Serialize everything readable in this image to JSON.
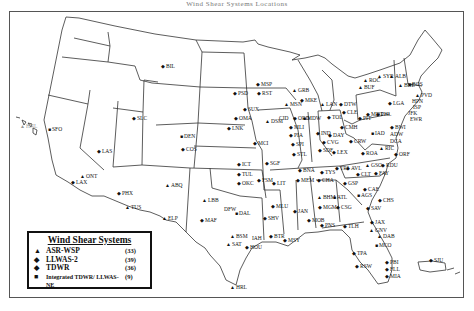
{
  "title": "Wind Shear Systems Locations",
  "legend": {
    "title": "Wind Shear Systems",
    "items": [
      {
        "symbol": "▲",
        "icon": "triangle-icon",
        "label": "ASR-WSP",
        "count": "(33)"
      },
      {
        "symbol": "◆",
        "icon": "diamond-icon",
        "label": "LLWAS-2",
        "count": "(39)"
      },
      {
        "symbol": "◆",
        "icon": "star-icon",
        "label": "TDWR",
        "count": "(36)"
      },
      {
        "symbol": "■",
        "icon": "square-icon",
        "label": "Integrated TDWR/ LLWAS-NE",
        "count": "(9)"
      }
    ]
  },
  "stations": [
    {
      "code": "BIL",
      "x": 164,
      "y": 66,
      "sym": "◆"
    },
    {
      "code": "SFO",
      "x": 51,
      "y": 129,
      "sym": "■"
    },
    {
      "code": "HNL",
      "x": 23,
      "y": 126,
      "sym": "▲",
      "gray": true
    },
    {
      "code": "SLC",
      "x": 135,
      "y": 118,
      "sym": "◆"
    },
    {
      "code": "LAS",
      "x": 100,
      "y": 151,
      "sym": "◆"
    },
    {
      "code": "LAX",
      "x": 74,
      "y": 182,
      "sym": "◆"
    },
    {
      "code": "ONT",
      "x": 83,
      "y": 176,
      "sym": "▲"
    },
    {
      "code": "PHX",
      "x": 120,
      "y": 193,
      "sym": "◆"
    },
    {
      "code": "TUS",
      "x": 128,
      "y": 207,
      "sym": "▲"
    },
    {
      "code": "ABQ",
      "x": 168,
      "y": 185,
      "sym": "▲"
    },
    {
      "code": "ELP",
      "x": 165,
      "y": 218,
      "sym": "▲"
    },
    {
      "code": "DEN",
      "x": 183,
      "y": 136,
      "sym": "■"
    },
    {
      "code": "COS",
      "x": 184,
      "y": 149,
      "sym": "◆"
    },
    {
      "code": "PSD",
      "x": 236,
      "y": 93,
      "sym": "◆"
    },
    {
      "code": "SUX",
      "x": 246,
      "y": 109,
      "sym": "◆"
    },
    {
      "code": "OMA",
      "x": 237,
      "y": 118,
      "sym": "◆"
    },
    {
      "code": "LNK",
      "x": 230,
      "y": 128,
      "sym": "◆"
    },
    {
      "code": "MSP",
      "x": 259,
      "y": 84,
      "sym": "◆"
    },
    {
      "code": "RST",
      "x": 260,
      "y": 93,
      "sym": "◆"
    },
    {
      "code": "DSM",
      "x": 268,
      "y": 121,
      "sym": "▲"
    },
    {
      "code": "MCI",
      "x": 256,
      "y": 143,
      "sym": "◆"
    },
    {
      "code": "ICT",
      "x": 240,
      "y": 164,
      "sym": "◆"
    },
    {
      "code": "SGF",
      "x": 268,
      "y": 163,
      "sym": "◆"
    },
    {
      "code": "TUL",
      "x": 240,
      "y": 174,
      "sym": "◆"
    },
    {
      "code": "OKC",
      "x": 240,
      "y": 183,
      "sym": "◆"
    },
    {
      "code": "FSM",
      "x": 260,
      "y": 180,
      "sym": "◆"
    },
    {
      "code": "LIT",
      "x": 275,
      "y": 183,
      "sym": "◆"
    },
    {
      "code": "LBB",
      "x": 205,
      "y": 200,
      "sym": "▲"
    },
    {
      "code": "MAF",
      "x": 203,
      "y": 220,
      "sym": "◆"
    },
    {
      "code": "DFW",
      "x": 227,
      "y": 209,
      "sym": ""
    },
    {
      "code": "DAL",
      "x": 238,
      "y": 213,
      "sym": "■"
    },
    {
      "code": "SHV",
      "x": 266,
      "y": 218,
      "sym": "◆"
    },
    {
      "code": "MLU",
      "x": 274,
      "y": 206,
      "sym": "◆"
    },
    {
      "code": "BSM",
      "x": 233,
      "y": 236,
      "sym": "▲"
    },
    {
      "code": "SAT",
      "x": 229,
      "y": 244,
      "sym": "▲"
    },
    {
      "code": "IAH",
      "x": 255,
      "y": 238,
      "sym": ""
    },
    {
      "code": "HOU",
      "x": 248,
      "y": 247,
      "sym": "◆"
    },
    {
      "code": "BTR",
      "x": 272,
      "y": 236,
      "sym": "◆"
    },
    {
      "code": "MSY",
      "x": 286,
      "y": 240,
      "sym": "◆"
    },
    {
      "code": "HRL",
      "x": 233,
      "y": 287,
      "sym": "▲"
    },
    {
      "code": "GRB",
      "x": 295,
      "y": 90,
      "sym": "▲"
    },
    {
      "code": "MKE",
      "x": 303,
      "y": 100,
      "sym": "◆"
    },
    {
      "code": "MSN",
      "x": 287,
      "y": 104,
      "sym": "▲"
    },
    {
      "code": "CID",
      "x": 282,
      "y": 118,
      "sym": ""
    },
    {
      "code": "ORD",
      "x": 296,
      "y": 118,
      "sym": "◆"
    },
    {
      "code": "MDW",
      "x": 306,
      "y": 118,
      "sym": "■"
    },
    {
      "code": "MLI",
      "x": 292,
      "y": 127,
      "sym": "◆"
    },
    {
      "code": "PIA",
      "x": 292,
      "y": 135,
      "sym": "◆"
    },
    {
      "code": "SPI",
      "x": 294,
      "y": 144,
      "sym": "◆"
    },
    {
      "code": "STL",
      "x": 295,
      "y": 154,
      "sym": "◆"
    },
    {
      "code": "LAN",
      "x": 323,
      "y": 104,
      "sym": "▲"
    },
    {
      "code": "DTW",
      "x": 342,
      "y": 104,
      "sym": "◆"
    },
    {
      "code": "TOL",
      "x": 330,
      "y": 117,
      "sym": "◆"
    },
    {
      "code": "CLE",
      "x": 345,
      "y": 112,
      "sym": "◆"
    },
    {
      "code": "CMH",
      "x": 343,
      "y": 127,
      "sym": "◆"
    },
    {
      "code": "PIT",
      "x": 361,
      "y": 118,
      "sym": "◆"
    },
    {
      "code": "IND",
      "x": 319,
      "y": 133,
      "sym": "◆"
    },
    {
      "code": "DAY",
      "x": 331,
      "y": 135,
      "sym": "◆"
    },
    {
      "code": "CVG",
      "x": 325,
      "y": 142,
      "sym": "◆"
    },
    {
      "code": "SDF",
      "x": 321,
      "y": 150,
      "sym": "◆"
    },
    {
      "code": "LEX",
      "x": 335,
      "y": 152,
      "sym": "◆"
    },
    {
      "code": "CRW",
      "x": 352,
      "y": 141,
      "sym": "◆"
    },
    {
      "code": "ROA",
      "x": 364,
      "y": 153,
      "sym": "◆"
    },
    {
      "code": "RIC",
      "x": 382,
      "y": 148,
      "sym": "▲"
    },
    {
      "code": "ORF",
      "x": 397,
      "y": 154,
      "sym": "◆"
    },
    {
      "code": "BUF",
      "x": 361,
      "y": 87,
      "sym": "▲"
    },
    {
      "code": "ROC",
      "x": 366,
      "y": 80,
      "sym": "▲"
    },
    {
      "code": "SYR",
      "x": 380,
      "y": 76,
      "sym": "▲"
    },
    {
      "code": "ALB",
      "x": 392,
      "y": 76,
      "sym": "▲"
    },
    {
      "code": "BDL",
      "x": 401,
      "y": 85,
      "sym": "▲"
    },
    {
      "code": "BOS",
      "x": 411,
      "y": 84,
      "sym": "■"
    },
    {
      "code": "PVD",
      "x": 418,
      "y": 95,
      "sym": "▲"
    },
    {
      "code": "HPN",
      "x": 415,
      "y": 101,
      "sym": ""
    },
    {
      "code": "ISP",
      "x": 416,
      "y": 107,
      "sym": ""
    },
    {
      "code": "LGA",
      "x": 391,
      "y": 103,
      "sym": "◆"
    },
    {
      "code": "JFK",
      "x": 411,
      "y": 113,
      "sym": ""
    },
    {
      "code": "EWR",
      "x": 413,
      "y": 119,
      "sym": ""
    },
    {
      "code": "MDT",
      "x": 369,
      "y": 114,
      "sym": "◆"
    },
    {
      "code": "PHL",
      "x": 379,
      "y": 114,
      "sym": "◆"
    },
    {
      "code": "BWI",
      "x": 393,
      "y": 127,
      "sym": "◆"
    },
    {
      "code": "ADW",
      "x": 393,
      "y": 134,
      "sym": ""
    },
    {
      "code": "DCA",
      "x": 393,
      "y": 141,
      "sym": ""
    },
    {
      "code": "IAD",
      "x": 374,
      "y": 133,
      "sym": "■"
    },
    {
      "code": "TYS",
      "x": 323,
      "y": 172,
      "sym": "◆"
    },
    {
      "code": "BNA",
      "x": 301,
      "y": 170,
      "sym": "◆"
    },
    {
      "code": "TRI",
      "x": 338,
      "y": 168,
      "sym": "◆"
    },
    {
      "code": "MEM",
      "x": 299,
      "y": 180,
      "sym": "◆"
    },
    {
      "code": "CHA",
      "x": 320,
      "y": 180,
      "sym": "◆"
    },
    {
      "code": "AVL",
      "x": 349,
      "y": 168,
      "sym": "◆"
    },
    {
      "code": "GSO",
      "x": 368,
      "y": 165,
      "sym": "▲"
    },
    {
      "code": "RDU",
      "x": 384,
      "y": 165,
      "sym": "◆"
    },
    {
      "code": "CLT",
      "x": 359,
      "y": 174,
      "sym": "◆"
    },
    {
      "code": "FAY",
      "x": 377,
      "y": 173,
      "sym": "◆"
    },
    {
      "code": "GSP",
      "x": 346,
      "y": 183,
      "sym": "◆"
    },
    {
      "code": "CAE",
      "x": 366,
      "y": 189,
      "sym": "◆"
    },
    {
      "code": "CHS",
      "x": 381,
      "y": 200,
      "sym": "◆"
    },
    {
      "code": "AGS",
      "x": 360,
      "y": 195,
      "sym": "■"
    },
    {
      "code": "BHM",
      "x": 320,
      "y": 197,
      "sym": "▲"
    },
    {
      "code": "ATL",
      "x": 336,
      "y": 197,
      "sym": "■"
    },
    {
      "code": "CSG",
      "x": 339,
      "y": 207,
      "sym": "◆"
    },
    {
      "code": "MGM",
      "x": 321,
      "y": 207,
      "sym": "◆"
    },
    {
      "code": "JAN",
      "x": 296,
      "y": 211,
      "sym": "◆"
    },
    {
      "code": "MOB",
      "x": 310,
      "y": 220,
      "sym": "◆"
    },
    {
      "code": "PNS",
      "x": 323,
      "y": 225,
      "sym": "◆"
    },
    {
      "code": "TLH",
      "x": 346,
      "y": 226,
      "sym": "◆"
    },
    {
      "code": "SAV",
      "x": 369,
      "y": 208,
      "sym": "◆"
    },
    {
      "code": "JAX",
      "x": 373,
      "y": 222,
      "sym": "◆"
    },
    {
      "code": "GNV",
      "x": 372,
      "y": 230,
      "sym": "▲"
    },
    {
      "code": "DAB",
      "x": 380,
      "y": 236,
      "sym": "▲"
    },
    {
      "code": "MCO",
      "x": 378,
      "y": 245,
      "sym": "■"
    },
    {
      "code": "TPA",
      "x": 355,
      "y": 253,
      "sym": "◆"
    },
    {
      "code": "RSW",
      "x": 358,
      "y": 266,
      "sym": "◆"
    },
    {
      "code": "PBI",
      "x": 388,
      "y": 262,
      "sym": "◆"
    },
    {
      "code": "FLL",
      "x": 388,
      "y": 269,
      "sym": "◆"
    },
    {
      "code": "MIA",
      "x": 388,
      "y": 276,
      "sym": "◆"
    },
    {
      "code": "SJU",
      "x": 432,
      "y": 260,
      "sym": "◆"
    }
  ]
}
